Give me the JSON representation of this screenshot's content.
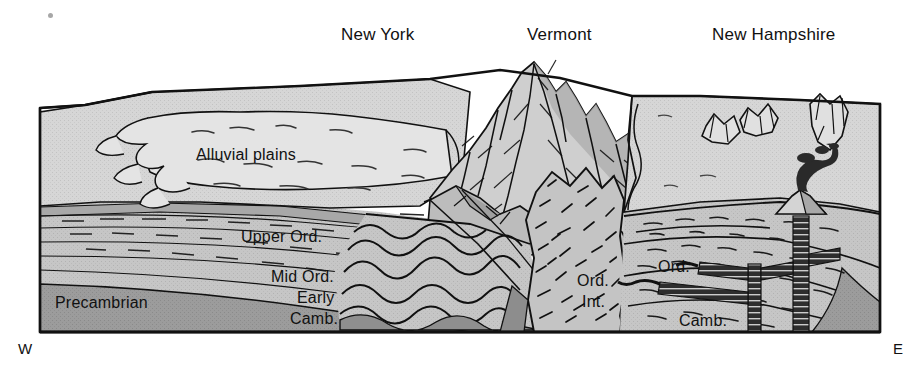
{
  "figure": {
    "type": "geologic-block-diagram",
    "title_labels": {
      "states": [
        {
          "name": "new-york",
          "label": "New York",
          "x": 341,
          "y": 25
        },
        {
          "name": "vermont",
          "label": "Vermont",
          "x": 527,
          "y": 25
        },
        {
          "name": "new-hampshire",
          "label": "New Hampshire",
          "x": 712,
          "y": 25
        }
      ]
    },
    "compass": {
      "west": {
        "label": "W",
        "x": 18,
        "y": 340
      },
      "east": {
        "label": "E",
        "x": 893,
        "y": 340
      }
    },
    "units": [
      {
        "name": "alluvial-plains",
        "label": "Alluvial plains",
        "x": 196,
        "y": 146
      },
      {
        "name": "upper-ordovician",
        "label": "Upper Ord.",
        "x": 241,
        "y": 228
      },
      {
        "name": "mid-ordovician",
        "label": "Mid Ord.",
        "x": 271,
        "y": 268
      },
      {
        "name": "early",
        "label": "Early",
        "x": 297,
        "y": 289
      },
      {
        "name": "cambrian",
        "label": "Camb.",
        "x": 290,
        "y": 310
      },
      {
        "name": "precambrian",
        "label": "Precambrian",
        "x": 55,
        "y": 294
      },
      {
        "name": "ordovician-intrusion-ord",
        "label": "Ord.",
        "x": 577,
        "y": 272
      },
      {
        "name": "ordovician-intrusion-int",
        "label": "Int.",
        "x": 582,
        "y": 293
      },
      {
        "name": "right-ordovician",
        "label": "Ord.",
        "x": 658,
        "y": 258
      },
      {
        "name": "right-cambrian",
        "label": "Camb.",
        "x": 679,
        "y": 312
      }
    ],
    "colors": {
      "surface_light": "#d9d9d9",
      "surface_plain": "#d0d0d0",
      "strata_light": "#c9c9c9",
      "strata_mid": "#bdbdbd",
      "precambrian": "#9a9a9a",
      "shadow_dark": "#8f8f8f",
      "mountain_light": "#cfcfcf",
      "mountain_shadow": "#a6a6a6",
      "intrusion_fill": "#c4c4c4",
      "dike": "#2b2b2b",
      "outline": "#000000",
      "background": "#ffffff"
    },
    "features": {
      "mountain_range": "Vermont Green Mountains peak",
      "volcano": "volcanic vent with smoke plume on east side",
      "dikes": "dark cross-cutting dike and sill intrusions on east",
      "folds": "contorted folded strata beneath mountain core",
      "hills": "small eroded hills on New Hampshire surface"
    },
    "artifact": {
      "name": "scan-speck",
      "x": 48,
      "y": 13
    }
  }
}
